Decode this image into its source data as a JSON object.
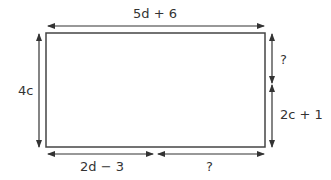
{
  "diagram": {
    "type": "rectangle-dimensions",
    "labels": {
      "top": "5d + 6",
      "left": "4c",
      "right_top": "?",
      "right_bottom": "2c + 1",
      "bottom_left": "2d − 3",
      "bottom_right": "?"
    },
    "colors": {
      "line": "#333333",
      "background": "#ffffff"
    }
  }
}
